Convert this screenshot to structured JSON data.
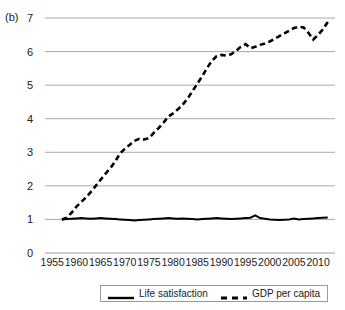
{
  "figure": {
    "panel_label": "(b)"
  },
  "legend": {
    "position": "bottom-center",
    "entries": [
      {
        "label": "Life satisfaction",
        "style": "solid",
        "color": "#000000"
      },
      {
        "label": "GDP per capita",
        "style": "dashed",
        "color": "#000000"
      }
    ]
  },
  "chart_data": {
    "type": "line",
    "title": "",
    "subtitle": "",
    "xlabel": "",
    "ylabel": "",
    "xlim": [
      1953.5,
      2013.5
    ],
    "ylim": [
      0,
      7
    ],
    "yticks": [
      0,
      1,
      2,
      3,
      4,
      5,
      6,
      7
    ],
    "ytick_labels": [
      "0",
      "1",
      "2",
      "3",
      "4",
      "5",
      "6",
      "7"
    ],
    "xticks": [
      1955,
      1960,
      1965,
      1970,
      1975,
      1980,
      1985,
      1990,
      1995,
      2000,
      2005,
      2010
    ],
    "xtick_labels": [
      "1955",
      "1960",
      "1965",
      "1970",
      "1975",
      "1980",
      "1985",
      "1990",
      "1995",
      "2000",
      "2005",
      "2010"
    ],
    "grid": "horizontal",
    "grid_color": "#9e9e9e",
    "annotations": [
      "(b)"
    ],
    "x": [
      1957,
      1958,
      1959,
      1960,
      1961,
      1962,
      1963,
      1964,
      1965,
      1966,
      1967,
      1968,
      1969,
      1970,
      1971,
      1972,
      1973,
      1974,
      1975,
      1976,
      1977,
      1978,
      1979,
      1980,
      1981,
      1982,
      1983,
      1984,
      1985,
      1986,
      1987,
      1988,
      1989,
      1990,
      1991,
      1992,
      1993,
      1994,
      1995,
      1996,
      1997,
      1998,
      1999,
      2000,
      2001,
      2002,
      2003,
      2004,
      2005,
      2006,
      2007,
      2008,
      2009,
      2010,
      2011,
      2012
    ],
    "series": [
      {
        "name": "Life satisfaction",
        "style": "solid",
        "color": "#000000",
        "values": [
          1.0,
          1.01,
          1.02,
          1.03,
          1.04,
          1.03,
          1.02,
          1.03,
          1.04,
          1.03,
          1.02,
          1.01,
          1.0,
          0.99,
          0.98,
          0.97,
          0.98,
          0.99,
          1.0,
          1.01,
          1.02,
          1.03,
          1.04,
          1.03,
          1.02,
          1.03,
          1.02,
          1.01,
          1.0,
          1.01,
          1.02,
          1.03,
          1.04,
          1.03,
          1.02,
          1.01,
          1.02,
          1.03,
          1.04,
          1.05,
          1.12,
          1.04,
          1.02,
          1.0,
          0.99,
          0.98,
          0.99,
          1.0,
          1.03,
          1.0,
          1.01,
          1.02,
          1.03,
          1.04,
          1.05,
          1.06
        ]
      },
      {
        "name": "GDP per capita",
        "style": "dashed",
        "color": "#000000",
        "values": [
          1.0,
          1.05,
          1.2,
          1.38,
          1.52,
          1.66,
          1.82,
          2.0,
          2.18,
          2.36,
          2.52,
          2.72,
          2.96,
          3.1,
          3.22,
          3.34,
          3.4,
          3.38,
          3.42,
          3.58,
          3.72,
          3.88,
          4.06,
          4.16,
          4.28,
          4.42,
          4.6,
          4.82,
          5.04,
          5.26,
          5.5,
          5.72,
          5.86,
          5.9,
          5.88,
          5.92,
          6.02,
          6.14,
          6.22,
          6.1,
          6.14,
          6.2,
          6.24,
          6.3,
          6.38,
          6.46,
          6.54,
          6.62,
          6.7,
          6.74,
          6.72,
          6.56,
          6.36,
          6.5,
          6.66,
          6.88
        ]
      }
    ]
  }
}
